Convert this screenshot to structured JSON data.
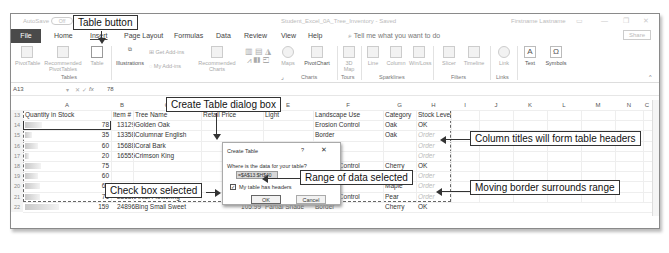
{
  "window": {
    "autosave_label": "AutoSave",
    "autosave_state": "Off",
    "document_title": "Student_Excel_0A_Tree_Inventory - Saved",
    "user_name": "Firstname Lastname",
    "controls": [
      "ribbon-display",
      "minimize",
      "restore",
      "close"
    ]
  },
  "menu": {
    "file": "File",
    "tabs": [
      "Home",
      "Insert",
      "Page Layout",
      "Formulas",
      "Data",
      "Review",
      "View",
      "Help"
    ],
    "active_tab": "Insert",
    "tell_me": "Tell me what you want to do",
    "share": "Share"
  },
  "ribbon": {
    "items": {
      "pivottable": "PivotTable",
      "recommended_pivottables": "Recommended PivotTables",
      "table": "Table",
      "illustrations": "Illustrations",
      "get_addins": "Get Add-ins",
      "my_addins": "My Add-ins",
      "recommended_charts": "Recommended Charts",
      "maps": "Maps",
      "pivotchart": "PivotChart",
      "3d_map": "3D Map",
      "line": "Line",
      "column": "Column",
      "winloss": "Win/Loss",
      "slicer": "Slicer",
      "timeline": "Timeline",
      "link": "Link",
      "text": "Text",
      "symbols": "Symbols"
    },
    "groups": [
      "Tables",
      "Charts",
      "Tours",
      "Sparklines",
      "Filters",
      "Links"
    ]
  },
  "formula_bar": {
    "name_box": "A13",
    "fx": "fx",
    "value": "78"
  },
  "sheet": {
    "columns": [
      "A",
      "B",
      "C",
      "D",
      "E",
      "F",
      "G",
      "H",
      "I",
      "J",
      "K",
      "L",
      "M",
      "N",
      "C"
    ],
    "header_row": {
      "row": "13",
      "cells": [
        "Quantity in Stock",
        "Item #",
        "Tree Name",
        "Retail Price",
        "Light",
        "Landscape Use",
        "Category",
        "Stock Level"
      ]
    },
    "rows": [
      {
        "row": "14",
        "qty": "78",
        "item": "13129",
        "name": "Golden Oak",
        "landscape": "Erosion Control",
        "category": "Oak",
        "stock": "OK",
        "bar": 0.49
      },
      {
        "row": "15",
        "qty": "35",
        "item": "13358",
        "name": "Columnar English",
        "landscape": "Border",
        "category": "Oak",
        "stock": "Order",
        "bar": 0.22
      },
      {
        "row": "16",
        "qty": "60",
        "item": "15688",
        "name": "Coral Bark",
        "landscape": "",
        "category": "",
        "stock": "Order",
        "bar": 0.38
      },
      {
        "row": "17",
        "qty": "20",
        "item": "16555",
        "name": "Crimson King",
        "landscape": "",
        "category": "",
        "stock": "Order",
        "bar": 0.13
      },
      {
        "row": "18",
        "qty": "75",
        "item": "",
        "name": "",
        "landscape": "Erosion Control",
        "category": "Cherry",
        "stock": "OK",
        "bar": 0.47
      },
      {
        "row": "19",
        "qty": "60",
        "item": "",
        "name": "",
        "landscape": "Erosion Control",
        "category": "Oak",
        "stock": "Order",
        "bar": 0.38
      },
      {
        "row": "20",
        "qty": "68",
        "item": "23677",
        "name": "Black Japanese",
        "landscape": "Border",
        "category": "Maple",
        "stock": "Order",
        "bar": 0.43
      },
      {
        "row": "21",
        "qty": "71",
        "item": "23688",
        "name": "Artist Flowering",
        "landscape": "Erosion Control",
        "category": "Pear",
        "stock": "Order",
        "bar": 0.45
      },
      {
        "row": "22",
        "qty": "159",
        "item": "24896",
        "name": "Bing Small Sweet",
        "price": "105.99",
        "light": "Partial Shade",
        "landscape": "Border",
        "category": "Cherry",
        "stock": "OK",
        "bar": 1.0
      }
    ]
  },
  "dialog": {
    "title": "Create Table",
    "help": "?",
    "close": "✕",
    "prompt": "Where is the data for your table?",
    "range": "=$A$13:$H$40",
    "checkbox_label": "My table has headers",
    "checkbox_checked": true,
    "ok": "OK",
    "cancel": "Cancel"
  },
  "callouts": {
    "table_button": "Table button",
    "create_table_dialog": "Create Table dialog box",
    "column_titles": "Column titles will form table headers",
    "range_selected": "Range of data selected",
    "check_box": "Check box selected",
    "moving_border": "Moving border surrounds range"
  }
}
